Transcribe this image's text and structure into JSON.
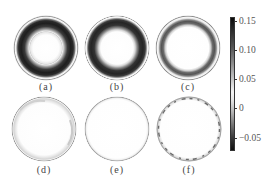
{
  "figure": {
    "panels": [
      {
        "id": "a",
        "label": "(a)",
        "cx": 46,
        "cy": 48,
        "r": 32,
        "pattern": "thick-dark-ring",
        "band_inner": 0.5,
        "band_outer": 0.9,
        "intensity": 0.95
      },
      {
        "id": "b",
        "label": "(b)",
        "cx": 117,
        "cy": 48,
        "r": 32,
        "pattern": "thick-dark-ring",
        "band_inner": 0.55,
        "band_outer": 0.92,
        "intensity": 0.92
      },
      {
        "id": "c",
        "label": "(c)",
        "cx": 188,
        "cy": 48,
        "r": 32,
        "pattern": "thin-gray-ring",
        "band_inner": 0.72,
        "band_outer": 0.92,
        "intensity": 0.75
      },
      {
        "id": "d",
        "label": "(d)",
        "cx": 44,
        "cy": 129,
        "r": 32,
        "pattern": "faint-rim",
        "intensity": 0.25
      },
      {
        "id": "e",
        "label": "(e)",
        "cx": 117,
        "cy": 129,
        "r": 32,
        "pattern": "faint-rim",
        "intensity": 0.12
      },
      {
        "id": "f",
        "label": "(f)",
        "cx": 189,
        "cy": 129,
        "r": 32,
        "pattern": "dashed-rim",
        "intensity": 0.6
      }
    ],
    "colorbar": {
      "min": -0.07,
      "max": 0.16,
      "colormap": "gray, black at extremes, white near 0.03",
      "ticks": [
        {
          "value": "0.15",
          "y": 21
        },
        {
          "value": "0.10",
          "y": 50
        },
        {
          "value": "0.05",
          "y": 79
        },
        {
          "value": "0",
          "y": 108
        },
        {
          "value": "−0.05",
          "y": 138
        }
      ]
    }
  }
}
